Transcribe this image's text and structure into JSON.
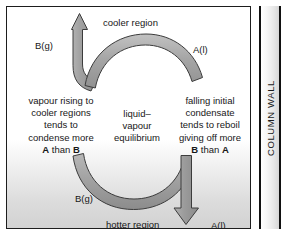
{
  "figure": {
    "type": "process-diagram"
  },
  "regions": {
    "cooler": "cooler region",
    "hotter": "hotter region"
  },
  "species_labels": {
    "top_left": "B(g)",
    "top_right": "A(l)",
    "bottom_left": "B(g)",
    "bottom_right": "A(l)"
  },
  "text_blocks": {
    "left": {
      "lines": [
        "vapour rising to",
        "cooler regions",
        "tends to",
        "condense more"
      ],
      "emphasis_line": {
        "bold_first": "A",
        "middle": " than ",
        "bold_last": "B"
      }
    },
    "center": {
      "lines": [
        "liquid–",
        "vapour",
        "equilibrium"
      ]
    },
    "right": {
      "lines": [
        "falling initial",
        "condensate",
        "tends to reboil",
        "giving off more"
      ],
      "emphasis_line": {
        "bold_first": "B",
        "middle": " than ",
        "bold_last": "A"
      }
    }
  },
  "column_wall": {
    "label": "COLUMN WALL"
  },
  "colors": {
    "arrow_fill": "#9a9a9a",
    "arrow_stroke": "#3c3c3c",
    "text": "#171717",
    "wall_border": "#111111",
    "panel_border": "#1d1d1d"
  }
}
